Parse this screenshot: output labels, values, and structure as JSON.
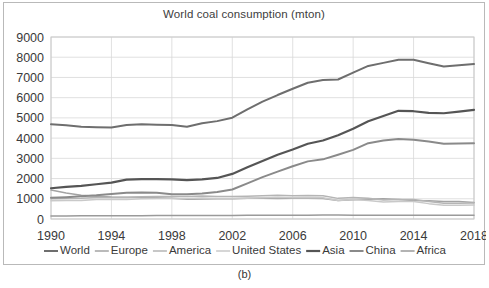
{
  "figure": {
    "caption": "(b)"
  },
  "chart_data": {
    "type": "line",
    "title": "World coal consumption (mton)",
    "xlabel": "",
    "ylabel": "",
    "xlim": [
      1990,
      2018
    ],
    "ylim": [
      0,
      9000
    ],
    "grid": true,
    "legend_position": "bottom",
    "y_ticks": [
      0,
      1000,
      2000,
      3000,
      4000,
      5000,
      6000,
      7000,
      8000,
      9000
    ],
    "x_ticks": [
      1990,
      1994,
      1998,
      2002,
      2006,
      2010,
      2014,
      2018
    ],
    "x": [
      1990,
      1991,
      1992,
      1993,
      1994,
      1995,
      1996,
      1997,
      1998,
      1999,
      2000,
      2001,
      2002,
      2003,
      2004,
      2005,
      2006,
      2007,
      2008,
      2009,
      2010,
      2011,
      2012,
      2013,
      2014,
      2015,
      2016,
      2017,
      2018
    ],
    "series": [
      {
        "name": "World",
        "color": "#6e6e6e",
        "width": 2.0,
        "values": [
          4680,
          4640,
          4560,
          4540,
          4530,
          4650,
          4680,
          4660,
          4650,
          4560,
          4730,
          4840,
          5010,
          5420,
          5800,
          6130,
          6440,
          6740,
          6870,
          6900,
          7240,
          7570,
          7720,
          7880,
          7870,
          7700,
          7540,
          7600,
          7660
        ]
      },
      {
        "name": "Europe",
        "color": "#a3a3a3",
        "width": 1.5,
        "values": [
          1430,
          1290,
          1180,
          1120,
          1090,
          1080,
          1080,
          1050,
          1020,
          980,
          990,
          1000,
          1000,
          1020,
          1020,
          1010,
          1030,
          1030,
          1010,
          920,
          950,
          980,
          1000,
          970,
          920,
          900,
          870,
          860,
          820
        ]
      },
      {
        "name": "America",
        "color": "#b5b5b5",
        "width": 1.5,
        "values": [
          1000,
          1010,
          1020,
          1060,
          1060,
          1060,
          1100,
          1110,
          1110,
          1110,
          1140,
          1110,
          1110,
          1130,
          1150,
          1170,
          1150,
          1160,
          1150,
          1020,
          1060,
          1020,
          940,
          970,
          960,
          860,
          780,
          780,
          790
        ]
      },
      {
        "name": "United States",
        "color": "#c9c9c9",
        "width": 1.5,
        "values": [
          900,
          910,
          920,
          960,
          960,
          960,
          1000,
          1010,
          1010,
          1010,
          1040,
          1010,
          1010,
          1030,
          1050,
          1070,
          1050,
          1060,
          1050,
          920,
          960,
          920,
          840,
          870,
          860,
          760,
          680,
          680,
          690
        ]
      },
      {
        "name": "Asia",
        "color": "#555555",
        "width": 2.2,
        "values": [
          1520,
          1590,
          1640,
          1720,
          1800,
          1950,
          1970,
          1970,
          1960,
          1920,
          1960,
          2030,
          2230,
          2560,
          2870,
          3180,
          3440,
          3720,
          3880,
          4140,
          4460,
          4830,
          5090,
          5350,
          5330,
          5250,
          5230,
          5310,
          5400
        ]
      },
      {
        "name": "China",
        "color": "#8a8a8a",
        "width": 2.0,
        "values": [
          1050,
          1080,
          1120,
          1170,
          1240,
          1300,
          1310,
          1300,
          1230,
          1220,
          1260,
          1340,
          1460,
          1760,
          2070,
          2340,
          2610,
          2850,
          2950,
          3180,
          3420,
          3750,
          3880,
          3960,
          3920,
          3830,
          3720,
          3730,
          3750
        ]
      },
      {
        "name": "Africa",
        "color": "#9a9a9a",
        "width": 1.5,
        "values": [
          150,
          152,
          155,
          157,
          160,
          163,
          165,
          168,
          170,
          170,
          172,
          175,
          178,
          182,
          185,
          188,
          188,
          190,
          192,
          192,
          190,
          188,
          188,
          190,
          190,
          188,
          185,
          185,
          185
        ]
      }
    ],
    "legend": [
      {
        "label": "World",
        "color": "#6e6e6e",
        "width": 2.0
      },
      {
        "label": "Europe",
        "color": "#a3a3a3",
        "width": 1.5
      },
      {
        "label": "America",
        "color": "#b5b5b5",
        "width": 1.5
      },
      {
        "label": "United States",
        "color": "#c9c9c9",
        "width": 1.5
      },
      {
        "label": "Asia",
        "color": "#555555",
        "width": 2.2
      },
      {
        "label": "China",
        "color": "#8a8a8a",
        "width": 2.0
      },
      {
        "label": "Africa",
        "color": "#9a9a9a",
        "width": 1.5
      }
    ]
  }
}
